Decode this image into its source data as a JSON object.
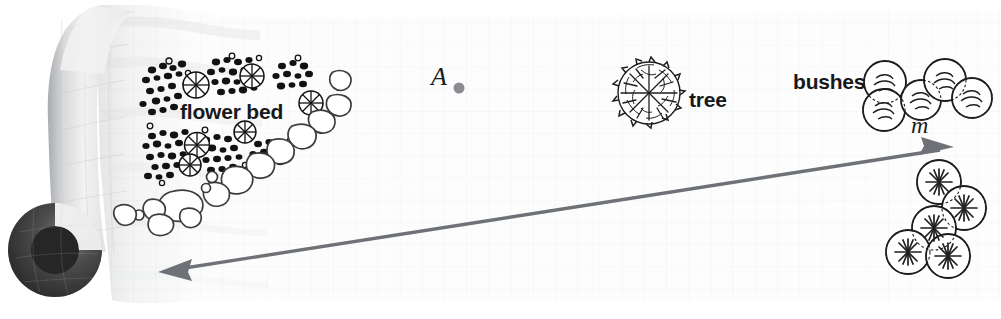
{
  "figure": {
    "kind": "rolled-graph-paper-garden-plan",
    "width": 1001,
    "height": 319,
    "background_color": "#ffffff",
    "paper_color": "#fbfbfb",
    "grid_color": "#dcdfe4",
    "grid_spacing_px": 22
  },
  "labels": {
    "flower_bed": "flower bed",
    "tree": "tree",
    "bushes": "bushes",
    "point_a": "A",
    "line_m": "m"
  },
  "colors": {
    "ink": "#17181a",
    "arrow": "#6e7176",
    "point_dot": "#8a8d91",
    "roll_dark": "#2b2b2b",
    "roll_light": "#e9e9ea"
  },
  "arrow": {
    "label": "m",
    "double_headed": true,
    "start_x": 160,
    "start_y": 272,
    "end_x": 952,
    "end_y": 148,
    "stroke_width": 3.4,
    "color": "#6e7176"
  },
  "point": {
    "label": "A",
    "x": 459,
    "y": 88,
    "radius": 5.5,
    "color": "#8a8d91"
  },
  "objects": [
    {
      "name": "flower-bed",
      "label": "flower bed",
      "type": "flower-bed",
      "cluster_count": 6,
      "pinwheel_count": 6,
      "stone_border": true,
      "region": {
        "x": 115,
        "y": 55,
        "w": 240,
        "h": 175
      }
    },
    {
      "name": "tree",
      "label": "tree",
      "type": "tree-canopy",
      "cx": 649,
      "cy": 93,
      "r": 31
    },
    {
      "name": "bushes-upper",
      "label": "bushes",
      "type": "bush-cluster-smooth",
      "lobe_count": 5,
      "region": {
        "x": 855,
        "y": 58,
        "w": 140,
        "h": 70
      }
    },
    {
      "name": "bushes-lower",
      "label": "",
      "type": "bush-cluster-star",
      "lobe_count": 5,
      "region": {
        "x": 885,
        "y": 160,
        "w": 105,
        "h": 115
      }
    }
  ],
  "paper_roll": {
    "name": "paper-roll",
    "side": "left",
    "curl_cx": 55,
    "curl_cy": 250,
    "curl_r": 47
  }
}
